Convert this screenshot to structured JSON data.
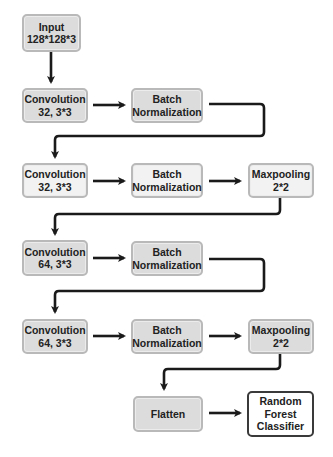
{
  "diagram": {
    "nodes": {
      "input": {
        "line1": "Input",
        "line2": "128*128*3"
      },
      "conv1": {
        "line1": "Convolution",
        "line2": "32, 3*3"
      },
      "bn1": {
        "line1": "Batch",
        "line2": "Normalization"
      },
      "conv2": {
        "line1": "Convolution",
        "line2": "32, 3*3"
      },
      "bn2": {
        "line1": "Batch",
        "line2": "Normalization"
      },
      "pool1": {
        "line1": "Maxpooling",
        "line2": "2*2"
      },
      "conv3": {
        "line1": "Convolution",
        "line2": "64, 3*3"
      },
      "bn3": {
        "line1": "Batch",
        "line2": "Normalization"
      },
      "conv4": {
        "line1": "Convolution",
        "line2": "64, 3*3"
      },
      "bn4": {
        "line1": "Batch",
        "line2": "Normalization"
      },
      "pool2": {
        "line1": "Maxpooling",
        "line2": "2*2"
      },
      "flatten": {
        "line1": "Flatten"
      },
      "classifier": {
        "line1": "Random",
        "line2": "Forest",
        "line3": "Classifier"
      }
    },
    "edges": [
      [
        "input",
        "conv1"
      ],
      [
        "conv1",
        "bn1"
      ],
      [
        "bn1",
        "conv2"
      ],
      [
        "conv2",
        "bn2"
      ],
      [
        "bn2",
        "pool1"
      ],
      [
        "pool1",
        "conv3"
      ],
      [
        "conv3",
        "bn3"
      ],
      [
        "bn3",
        "conv4"
      ],
      [
        "conv4",
        "bn4"
      ],
      [
        "bn4",
        "pool2"
      ],
      [
        "pool2",
        "flatten"
      ],
      [
        "flatten",
        "classifier"
      ]
    ],
    "colors": {
      "box_fill": "#dcdcdc",
      "box_border": "#b9b9b9",
      "final_border": "#3a3a3a",
      "arrow": "#1a1a1a"
    }
  }
}
